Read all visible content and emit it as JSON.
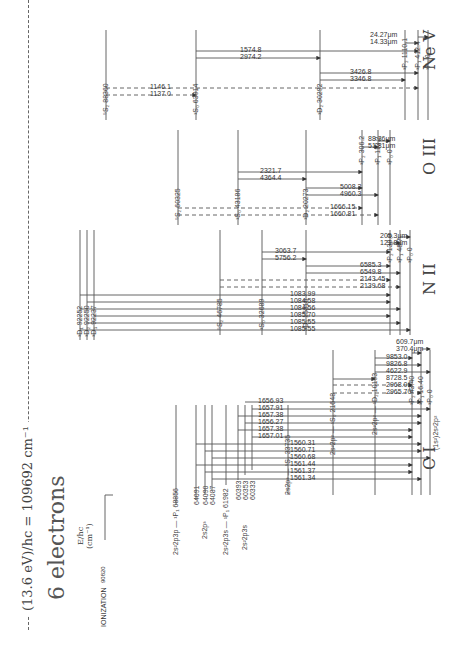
{
  "header": {
    "rydberg_line": "(13.6 eV)/hc = 109692 cm⁻¹",
    "title": "6 electrons",
    "axis_label_1": "E/hc",
    "axis_label_2": "(cm⁻¹)",
    "ionization_label": "IONIZATION",
    "ionization_value": "90820"
  },
  "ci": {
    "name": "C I",
    "config_labels": {
      "p3p": "2s²2p3p — ¹P₁ 68856",
      "p3_upper": "2s2p³",
      "p3s_single": "2s²2p3s — ¹P₁ 61982",
      "p3s_triplet": "2s²2p3s",
      "p3_5S": "2s2p³ — ⁵S₂ 33735",
      "1S0": "2s²2p² — ¹S₀ 21648",
      "1D2": "2s²2p² — ¹D₂ 10193",
      "ground": "(1s²)2s²2p²"
    },
    "upper_levels": [
      {
        "term": "³D₁",
        "energy": "64091"
      },
      {
        "term": "³D₂",
        "energy": "64090"
      },
      {
        "term": "³D₃",
        "energy": "64087"
      },
      {
        "term": "³P₂",
        "energy": "60393"
      },
      {
        "term": "³P₁",
        "energy": "60353"
      },
      {
        "term": "³P₀",
        "energy": "60333"
      }
    ],
    "ground_levels": [
      {
        "term": "³P₂",
        "energy": "43.40"
      },
      {
        "term": "³P₁",
        "energy": "16.40"
      },
      {
        "term": "³P₀",
        "energy": "0"
      }
    ],
    "wavelengths_3D": [
      "1561.34",
      "1561.37",
      "1561.44",
      "1560.68",
      "1560.71",
      "1560.31"
    ],
    "wavelengths_3P": [
      "1657.01",
      "1657.38",
      "1656.27",
      "1657.38",
      "1657.91",
      "1656.93"
    ],
    "wavelengths_forbidden": [
      "2965.70",
      "2968.06",
      "8728.5",
      "4622.9",
      "9826.8",
      "9853.0"
    ],
    "wavelengths_ir": [
      "370.4μm",
      "609.7μm"
    ]
  },
  "nii": {
    "name": "N II",
    "upper_levels": [
      {
        "term": "³D₁",
        "energy": "92252"
      },
      {
        "term": "³D₂",
        "energy": "92250"
      },
      {
        "term": "³D₃",
        "energy": "92237"
      }
    ],
    "levels": {
      "5S2": "⁵S₂ 46785",
      "1S0": "¹S₀ 32689",
      "1D2": "¹D₂ 15316"
    },
    "ground_levels": [
      {
        "term": "³P₂",
        "energy": "130.8"
      },
      {
        "term": "³P₁",
        "energy": "48.7"
      },
      {
        "term": "³P₀",
        "energy": "0"
      }
    ],
    "wavelengths_3D": [
      "1085.55",
      "1085.55",
      "1085.70",
      "1084.56",
      "1084.58",
      "1083.99"
    ],
    "wavelengths_forbidden": [
      "2139.68",
      "2143.45",
      "6549.8",
      "6585.3",
      "5756.2",
      "3063.7"
    ],
    "wavelengths_ir": [
      "121.8μm",
      "205.3μm"
    ]
  },
  "oiii": {
    "name": "O III",
    "levels": {
      "5S2": "⁵S₂ 60325",
      "1S0": "¹S₀ 43186",
      "1D2": "¹D₂ 20273"
    },
    "ground_levels": [
      {
        "term": "³P₂",
        "energy": "306.2"
      },
      {
        "term": "³P₁",
        "energy": "113.2"
      },
      {
        "term": "³P₀",
        "energy": "0"
      }
    ],
    "wavelengths_forbidden": [
      "1660.81",
      "1666.15",
      "4960.3",
      "5008.2",
      "4364.4",
      "2321.7"
    ],
    "wavelengths_ir": [
      "51.81μm",
      "88.36μm"
    ]
  },
  "nev": {
    "name": "Ne V",
    "levels": {
      "5S2": "⁵S₂ 88360",
      "1S0": "¹S₀ 63914",
      "1D2": "¹D₂ 30292"
    },
    "ground_levels": [
      {
        "term": "³P₂",
        "energy": "1110.1"
      },
      {
        "term": "³P₁",
        "energy": "412.4"
      },
      {
        "term": "³P₀",
        "energy": "0"
      }
    ],
    "wavelengths_forbidden": [
      "1137.0",
      "1146.1",
      "3346.8",
      "3426.8",
      "2974.2",
      "1574.8"
    ],
    "wavelengths_ir": [
      "14.33μm",
      "24.27μm"
    ]
  }
}
